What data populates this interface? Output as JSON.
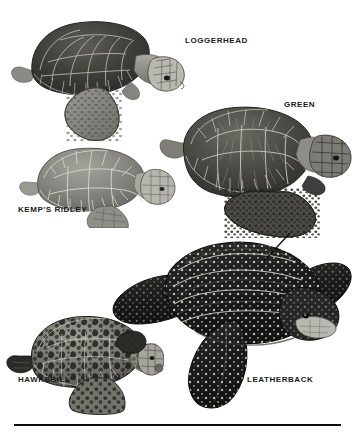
{
  "plate": {
    "title": "Sea Turtle Species Identification Plate",
    "background_color": "#ffffff",
    "width": 354,
    "height": 437
  },
  "labels": {
    "loggerhead": "LOGGERHEAD",
    "green": "GREEN",
    "kemps_ridley": "KEMP'S RIDLEY",
    "hawksbill": "HAWKSBILL",
    "leatherback": "LEATHERBACK"
  },
  "figures": [
    {
      "name": "loggerhead-turtle",
      "label": "LOGGERHEAD",
      "shell_tone": "#4a4a48",
      "body_tone": "#8e8d88",
      "description": "large dark carapace with thick scutes, pale blocky head, mottled front flipper"
    },
    {
      "name": "green-turtle",
      "label": "GREEN",
      "shell_tone": "#55554f",
      "body_tone": "#7f7e78",
      "description": "broad rounded carapace viewed from above-side, radiating scute striations, dark spotted flippers"
    },
    {
      "name": "kemps-ridley-turtle",
      "label": "KEMP'S RIDLEY",
      "shell_tone": "#8a8a84",
      "body_tone": "#9c9b95",
      "description": "light grey nearly circular carapace, small pale speckled head"
    },
    {
      "name": "leatherback-turtle",
      "label": "LEATHERBACK",
      "shell_tone": "#1f1f1f",
      "body_tone": "#2a2a2a",
      "description": "very dark ridged leathery carapace covered in white spots, very long front flippers, pale throat"
    },
    {
      "name": "hawksbill-turtle",
      "label": "HAWKSBILL",
      "shell_tone": "#6e6d66",
      "body_tone": "#8a8983",
      "description": "mottled tortoiseshell carapace with dark blotches, pointed beak, serrated rear margin"
    }
  ],
  "annotations": {
    "pointer_line": {
      "name": "leatherback-pointer-line",
      "color": "#0d0d0d"
    },
    "bottom_rule": {
      "name": "bottom-rule",
      "color": "#0d0d0d"
    }
  }
}
